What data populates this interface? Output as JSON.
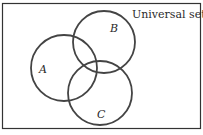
{
  "diagram": {
    "type": "venn",
    "universe_label": "Universal set",
    "sets": [
      {
        "name": "A",
        "label": "A"
      },
      {
        "name": "B",
        "label": "B"
      },
      {
        "name": "C",
        "label": "C"
      }
    ],
    "colors": {
      "stroke": "#444444",
      "frame": "#333333",
      "text": "#2a2a2a"
    }
  }
}
